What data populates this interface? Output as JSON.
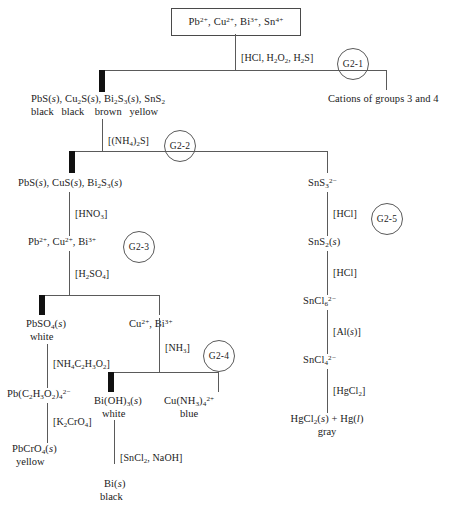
{
  "diagram": {
    "start_box": "Pb2+, Cu2+, Bi3+, Sn4+",
    "steps": [
      {
        "id": "G2-1",
        "reagent": "[HCl, H2O2, H2S]"
      },
      {
        "id": "G2-2",
        "reagent": "[(NH4)2S]"
      },
      {
        "id": "G2-3",
        "reagent": "[HNO3]"
      },
      {
        "id": "G2-4",
        "reagent": "[NH3]"
      },
      {
        "id": "G2-5",
        "reagent": "[HCl]"
      }
    ],
    "reagents": {
      "r1": "[HCl, H2O2, H2S]",
      "r2": "[(NH4)2S]",
      "r3": "[HNO3]",
      "r4": "[H2SO4]",
      "r5": "[NH4C2H3O2]",
      "r6": "[K2CrO4]",
      "r7": "[NH3]",
      "r8": "[SnCl2, NaOH]",
      "r9": "[HCl]",
      "r10": "[HCl]",
      "r11": "[Al(s)]",
      "r12": "[HgCl2]"
    },
    "nodes": {
      "sulfide_mix": "PbS(s), Cu2S(s), Bi2S3(s), SnS2",
      "sulfide_colors": "black    black    brown   yellow",
      "soluble_branch": "Cations of groups 3 and 4",
      "acid_insoluble": "PbS(s), CuS(s), Bi2S3(s)",
      "thiostannate": "SnS3 2-",
      "sns2": "SnS2(s)",
      "sncl6": "SnCl6 2-",
      "sncl4": "SnCl4 2-",
      "mercury_products": "HgCl2(s) + Hg(l)",
      "mercury_color": "gray",
      "nitrate_ions": "Pb2+, Cu2+, Bi3+",
      "lead_sulfate": "PbSO4(s)",
      "lead_sulfate_color": "white",
      "cu_bi_ions": "Cu2+, Bi3+",
      "lead_acetate": "Pb(C2H3O2)4 2-",
      "lead_chromate": "PbCrO4(s)",
      "lead_chromate_color": "yellow",
      "bismuth_hydroxide": "Bi(OH)3(s)",
      "bismuth_hydroxide_color": "white",
      "copper_ammine": "Cu(NH3)4 2+",
      "copper_ammine_color": "blue",
      "bismuth_metal": "Bi(s)",
      "bismuth_metal_color": "black"
    },
    "colors": {
      "line": "#5a5a5a",
      "precipitate_bar": "#111111",
      "text": "#1a1a1a"
    }
  }
}
